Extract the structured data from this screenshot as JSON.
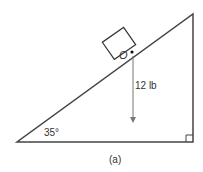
{
  "diagram": {
    "block_label": "O",
    "force_label": "12 lb",
    "angle_label": "35°",
    "caption": "(a)",
    "colors": {
      "line": "#444444",
      "text": "#333333",
      "arrow": "#666666"
    }
  }
}
